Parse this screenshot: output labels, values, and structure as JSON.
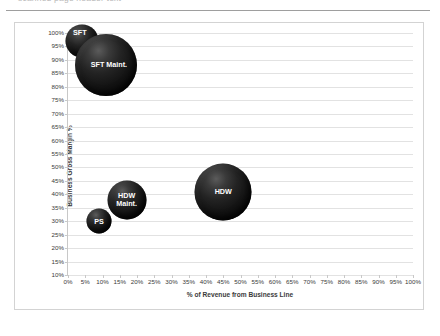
{
  "top_strip": {
    "ghost_text": "scanned page header text"
  },
  "chart_data": {
    "type": "scatter",
    "subtype": "bubble",
    "title": "",
    "xlabel": "% of Revenue from Business Line",
    "ylabel": "Business Gross Margin %",
    "xlim": [
      0,
      100
    ],
    "ylim": [
      10,
      100
    ],
    "xtick_step": 5,
    "ytick_step": 5,
    "grid": "horizontal",
    "legend": "none",
    "bubble_color": "#111111",
    "label_color": "#ffffff",
    "xticks": [
      "0%",
      "5%",
      "10%",
      "15%",
      "20%",
      "25%",
      "30%",
      "35%",
      "40%",
      "45%",
      "50%",
      "55%",
      "60%",
      "65%",
      "70%",
      "75%",
      "80%",
      "85%",
      "90%",
      "95%",
      "100%"
    ],
    "yticks": [
      "10%",
      "15%",
      "20%",
      "25%",
      "30%",
      "35%",
      "40%",
      "45%",
      "50%",
      "55%",
      "60%",
      "65%",
      "70%",
      "75%",
      "80%",
      "85%",
      "90%",
      "95%",
      "100%"
    ],
    "points": [
      {
        "label": "SFT",
        "x": 4,
        "y": 97,
        "size": 33,
        "label_dx": -2,
        "label_dy": -9
      },
      {
        "label": "SFT Maint.",
        "x": 11,
        "y": 88,
        "size": 62,
        "label_dx": 3,
        "label_dy": 0
      },
      {
        "label": "HDW",
        "x": 45,
        "y": 41,
        "size": 57,
        "label_dx": 0,
        "label_dy": 0
      },
      {
        "label": "HDW\nMaint.",
        "x": 17,
        "y": 38,
        "size": 39,
        "label_dx": 0,
        "label_dy": 0
      },
      {
        "label": "PS",
        "x": 9,
        "y": 30,
        "size": 25,
        "label_dx": 0,
        "label_dy": 0
      }
    ]
  }
}
